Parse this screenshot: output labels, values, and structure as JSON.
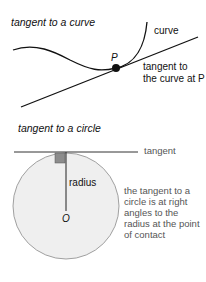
{
  "curve_section": {
    "heading": "tangent to a curve",
    "label_curve": "curve",
    "label_point": "P",
    "label_tangent_line1": "tangent to",
    "label_tangent_line2": "the curve at P"
  },
  "circle_section": {
    "heading": "tangent to a circle",
    "label_tangent": "tangent",
    "label_radius": "radius",
    "label_center": "O",
    "description": [
      "the tangent to a",
      "circle is at right",
      "angles to the",
      "radius at the point",
      "of contact"
    ]
  },
  "colors": {
    "line": "#111111",
    "circle_fill": "#efefef",
    "circle_stroke": "#8a8a8a",
    "right_angle_square": "#8c8c8c",
    "description_text": "#555555"
  }
}
